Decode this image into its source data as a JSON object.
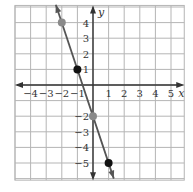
{
  "chart_data": {
    "type": "line",
    "title": "",
    "xlabel": "x",
    "ylabel": "y",
    "xlim": [
      -5,
      5.85
    ],
    "ylim": [
      -6.1,
      5.1
    ],
    "grid": true,
    "x_ticks": [
      -4,
      -3,
      -2,
      -1,
      1,
      2,
      3,
      4,
      5
    ],
    "y_ticks": [
      4,
      3,
      2,
      1,
      -2,
      -3,
      -4,
      -5
    ],
    "x_tick_labels": [
      "−4",
      "−3",
      "−2",
      "−1",
      "1",
      "2",
      "3",
      "4",
      "5"
    ],
    "y_tick_labels": [
      "4",
      "3",
      "2",
      "1",
      "−2",
      "−3",
      "−4",
      "−5"
    ],
    "line": {
      "slope": -3,
      "intercept": -2,
      "equation": "y = -3x - 2",
      "arrows_both_ends": true
    },
    "points": [
      {
        "x": -2,
        "y": 4,
        "color": "#8a8a8a"
      },
      {
        "x": -1,
        "y": 1,
        "color": "#111111"
      },
      {
        "x": 0,
        "y": -2,
        "color": "#8a8a8a"
      },
      {
        "x": 1,
        "y": -5,
        "color": "#111111"
      }
    ]
  },
  "colors": {
    "grid": "#b5b5b5",
    "axis": "#333333",
    "line": "#555555"
  }
}
